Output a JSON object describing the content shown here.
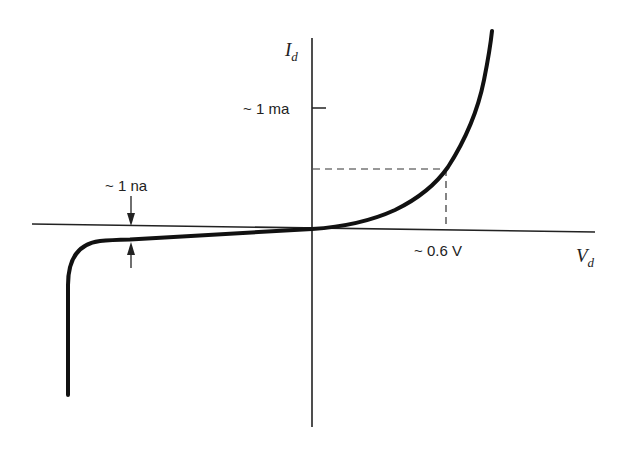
{
  "diagram": {
    "type": "diode I-V characteristic curve",
    "axes": {
      "x_label": "V",
      "x_label_sub": "d",
      "y_label": "I",
      "y_label_sub": "d"
    },
    "annotations": {
      "forward_current": "~ 1 ma",
      "forward_voltage": "~ 0.6 V",
      "reverse_leakage": "~ 1 na"
    },
    "colors": {
      "curve": "#111111",
      "axis": "#222222",
      "dashed": "#333333",
      "background": "#ffffff"
    }
  }
}
